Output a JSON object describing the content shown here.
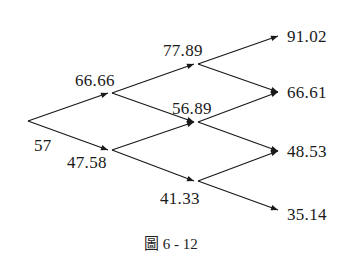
{
  "figure": {
    "caption": "圖 6 - 12",
    "type": "binomial-tree",
    "nodes": {
      "root": "57",
      "up1": "66.66",
      "down1": "47.58",
      "uu": "77.89",
      "ud": "56.89",
      "dd": "41.33",
      "uuu": "91.02",
      "uud": "66.61",
      "udd": "48.53",
      "ddd": "35.14"
    }
  }
}
